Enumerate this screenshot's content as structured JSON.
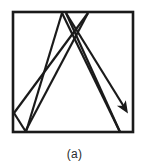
{
  "figure": {
    "caption": "(a)",
    "kind": "geometric-diagram",
    "colors": {
      "background": "#ffffff",
      "stroke": "#1a1a1a",
      "caption_text": "#2b2b2b"
    },
    "frame": {
      "name": "square-border",
      "x": 13,
      "y": 12,
      "width": 120,
      "height": 120,
      "stroke_width": 2.6
    },
    "trajectory": {
      "name": "billiard-path",
      "stroke_width": 2.2,
      "points": [
        [
          25,
          132
        ],
        [
          88,
          13
        ],
        [
          14,
          113
        ],
        [
          14,
          113
        ],
        [
          26,
          132
        ],
        [
          62,
          13
        ],
        [
          120,
          132
        ],
        [
          62,
          13
        ],
        [
          66,
          13
        ],
        [
          126,
          110
        ]
      ],
      "segments": [
        {
          "name": "segment-1",
          "from": [
            25,
            132
          ],
          "to": [
            88,
            13
          ]
        },
        {
          "name": "segment-2",
          "from": [
            88,
            13
          ],
          "to": [
            14,
            113
          ]
        },
        {
          "name": "segment-3",
          "from": [
            14,
            113
          ],
          "to": [
            26,
            132
          ]
        },
        {
          "name": "segment-4",
          "from": [
            26,
            132
          ],
          "to": [
            62,
            13
          ]
        },
        {
          "name": "segment-5",
          "from": [
            62,
            13
          ],
          "to": [
            120,
            132
          ]
        },
        {
          "name": "segment-6",
          "from": [
            120,
            132
          ],
          "to": [
            66,
            13
          ]
        },
        {
          "name": "segment-7",
          "from": [
            66,
            13
          ],
          "to": [
            126,
            110
          ]
        }
      ],
      "arrowhead": {
        "name": "direction-arrowhead",
        "tip": [
          127,
          112
        ],
        "size": 9
      }
    }
  }
}
